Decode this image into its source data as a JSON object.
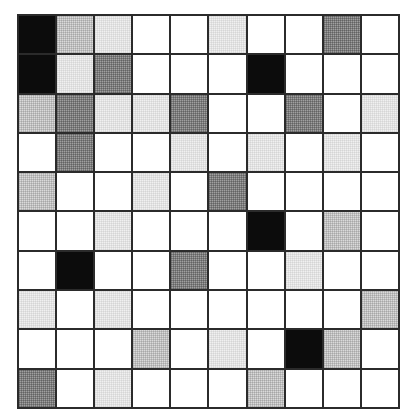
{
  "figure": {
    "kind": "grid-heatmap",
    "rows": 10,
    "cols": 10,
    "border_color": "#2b2b2b"
  },
  "palette": {
    "white": "#ffffff",
    "vlight": "#f0f0f0",
    "light": "#dadada",
    "medium": "#a0a0a0",
    "black": "#0c0c0c"
  },
  "chart_data": {
    "type": "heatmap",
    "title": "",
    "xlabel": "",
    "ylabel": "",
    "categories_x": [
      "1",
      "2",
      "3",
      "4",
      "5",
      "6",
      "7",
      "8",
      "9",
      "10"
    ],
    "categories_y": [
      "1",
      "2",
      "3",
      "4",
      "5",
      "6",
      "7",
      "8",
      "9",
      "10"
    ],
    "levels": [
      "white",
      "vlight",
      "light",
      "medium",
      "black"
    ],
    "level_values": {
      "white": 0,
      "vlight": 1,
      "light": 2,
      "medium": 3,
      "black": 4
    },
    "grid": true,
    "legend": "none",
    "cells": [
      [
        "black",
        "light",
        "vlight",
        "white",
        "white",
        "vlight",
        "white",
        "white",
        "medium",
        "white"
      ],
      [
        "black",
        "vlight",
        "medium",
        "white",
        "white",
        "white",
        "black",
        "white",
        "white",
        "white"
      ],
      [
        "light",
        "medium",
        "vlight",
        "vlight",
        "medium",
        "white",
        "white",
        "medium",
        "white",
        "vlight"
      ],
      [
        "white",
        "medium",
        "white",
        "white",
        "vlight",
        "white",
        "vlight",
        "white",
        "vlight",
        "white"
      ],
      [
        "light",
        "white",
        "white",
        "vlight",
        "white",
        "medium",
        "white",
        "white",
        "white",
        "white"
      ],
      [
        "white",
        "white",
        "vlight",
        "white",
        "white",
        "white",
        "black",
        "white",
        "light",
        "white"
      ],
      [
        "white",
        "black",
        "white",
        "white",
        "medium",
        "white",
        "white",
        "vlight",
        "white",
        "white"
      ],
      [
        "vlight",
        "white",
        "vlight",
        "white",
        "white",
        "white",
        "white",
        "white",
        "white",
        "light"
      ],
      [
        "white",
        "white",
        "white",
        "light",
        "white",
        "vlight",
        "white",
        "black",
        "light",
        "white"
      ],
      [
        "medium",
        "white",
        "vlight",
        "white",
        "white",
        "white",
        "light",
        "white",
        "white",
        "white"
      ]
    ],
    "values": [
      [
        4,
        2,
        1,
        0,
        0,
        1,
        0,
        0,
        3,
        0
      ],
      [
        4,
        1,
        3,
        0,
        0,
        0,
        4,
        0,
        0,
        0
      ],
      [
        2,
        3,
        1,
        1,
        3,
        0,
        0,
        3,
        0,
        1
      ],
      [
        0,
        3,
        0,
        0,
        1,
        0,
        1,
        0,
        1,
        0
      ],
      [
        2,
        0,
        0,
        1,
        0,
        3,
        0,
        0,
        0,
        0
      ],
      [
        0,
        0,
        1,
        0,
        0,
        0,
        4,
        0,
        2,
        0
      ],
      [
        0,
        4,
        0,
        0,
        3,
        0,
        0,
        1,
        0,
        0
      ],
      [
        1,
        0,
        1,
        0,
        0,
        0,
        0,
        0,
        0,
        2
      ],
      [
        0,
        0,
        0,
        2,
        0,
        1,
        0,
        4,
        2,
        0
      ],
      [
        3,
        0,
        1,
        0,
        0,
        0,
        2,
        0,
        0,
        0
      ]
    ]
  }
}
